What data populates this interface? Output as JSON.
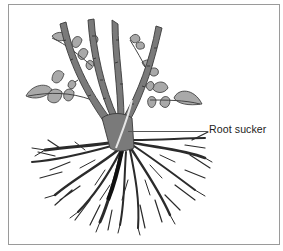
{
  "figure": {
    "callouts": [
      {
        "label": "Root sucker",
        "target": "pale shoot emerging from below the bud union"
      }
    ]
  },
  "colors": {
    "frame_border": "#9a9a9a",
    "cane_fill": "#7a7a7a",
    "cane_outline": "#3a3a3a",
    "leaf_fill": "#a9a9a9",
    "root": "#2b2b2b",
    "sucker": "#e6e6e6",
    "label_text": "#222222"
  }
}
